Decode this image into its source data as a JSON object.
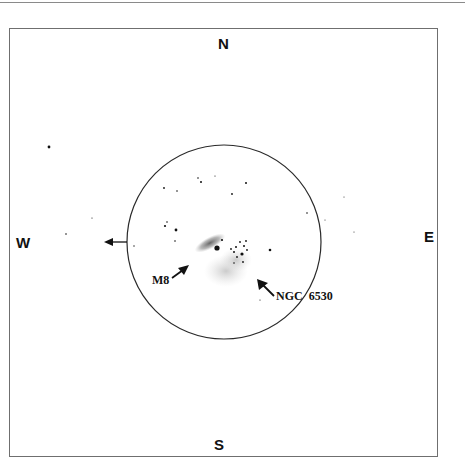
{
  "chart": {
    "compass": {
      "north": "N",
      "south": "S",
      "east": "E",
      "west": "W"
    },
    "field_of_view": {
      "center_x": 224,
      "center_y": 242,
      "radius": 97
    },
    "objects": [
      {
        "id": "m8",
        "label": "M8",
        "type": "nebula"
      },
      {
        "id": "ngc6530",
        "label": "NGC  6530",
        "type": "open-cluster"
      }
    ],
    "drift_arrow": {
      "direction": "west"
    },
    "colors": {
      "ink": "#111111",
      "frame": "#6f6f6f",
      "nebula": "#7a7a7a",
      "nebula_faint": "#bdbdbd"
    }
  }
}
